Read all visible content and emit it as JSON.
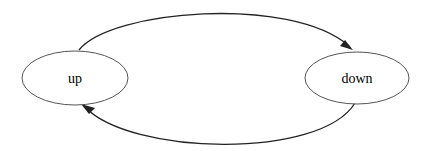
{
  "diagram": {
    "type": "state-diagram",
    "nodes": [
      {
        "id": "up",
        "label": "up",
        "cx": 75,
        "cy": 78,
        "rx": 53,
        "ry": 27
      },
      {
        "id": "down",
        "label": "down",
        "cx": 357,
        "cy": 78,
        "rx": 52,
        "ry": 26
      }
    ],
    "edges": [
      {
        "from": "up",
        "to": "down",
        "route": "top-arc"
      },
      {
        "from": "down",
        "to": "up",
        "route": "bottom-arc"
      }
    ],
    "colors": {
      "node_stroke": "#555555",
      "edge_stroke": "#222222",
      "background": "#ffffff"
    }
  }
}
